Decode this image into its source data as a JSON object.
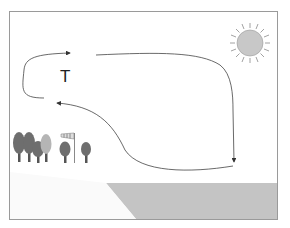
{
  "diagram": {
    "land_label": "T",
    "elements": {
      "sun": "sun-icon",
      "trees": "tree-icons",
      "windsock": "windsock-icon",
      "sea": "sea-area",
      "land": "land-area"
    },
    "colors": {
      "frame": "#9a9a9a",
      "sun_fill": "#c8c8c8",
      "sun_rays": "#8a8a8a",
      "sea": "#c2c2c2",
      "arrow": "#444444",
      "tree_dark": "#6e6e6e",
      "tree_light": "#b5b5b5"
    }
  }
}
